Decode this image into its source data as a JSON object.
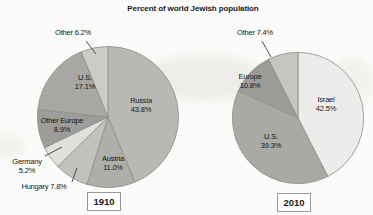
{
  "title": "Percent of world Jewish population",
  "chart_data": [
    {
      "type": "pie",
      "year": "1910",
      "title": "Percent of world Jewish population",
      "direction": "clockwise",
      "start_angle": "12 o'clock",
      "legend_position": "none",
      "slices": [
        {
          "label": "Russia",
          "value": 43.8,
          "pct": "43.8%",
          "color": "#b8b9b5"
        },
        {
          "label": "Austria",
          "value": 11.0,
          "pct": "11.0%",
          "color": "#aeafab"
        },
        {
          "label": "Hungary",
          "value": 7.8,
          "pct": "7.8%",
          "color": "#c1c2be"
        },
        {
          "label": "Germany",
          "value": 5.2,
          "pct": "5.2%",
          "color": "#e0e1dd"
        },
        {
          "label": "Other Europe",
          "value": 8.9,
          "pct": "8.9%",
          "color": "#9c9d99"
        },
        {
          "label": "U.S.",
          "value": 17.1,
          "pct": "17.1%",
          "color": "#a7a8a4"
        },
        {
          "label": "Other",
          "value": 6.2,
          "pct": "6.2%",
          "color": "#cbccc8"
        }
      ]
    },
    {
      "type": "pie",
      "year": "2010",
      "title": "Percent of world Jewish population",
      "direction": "clockwise",
      "start_angle": "12 o'clock",
      "legend_position": "none",
      "slices": [
        {
          "label": "Israel",
          "value": 42.5,
          "pct": "42.5%",
          "color": "#ecedeb"
        },
        {
          "label": "U.S.",
          "value": 39.3,
          "pct": "39.3%",
          "color": "#a9aaa6"
        },
        {
          "label": "Europe",
          "value": 10.8,
          "pct": "10.8%",
          "color": "#9b9c98"
        },
        {
          "label": "Other",
          "value": 7.4,
          "pct": "7.4%",
          "color": "#c5c6c2"
        }
      ]
    }
  ],
  "style": {
    "slice_stroke_color": "#8e8f8b",
    "leader_line_color": "#3c3c3c"
  }
}
